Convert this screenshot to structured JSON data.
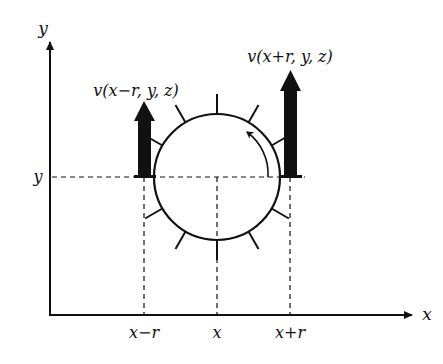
{
  "diagram": {
    "axes": {
      "x_label": "x",
      "y_label": "y"
    },
    "ticks": {
      "x_minus_r": "x−r",
      "x": "x",
      "x_plus_r": "x+r",
      "y": "y"
    },
    "vectors": {
      "left": "v(x−r, y, z)",
      "right": "v(x+r, y, z)"
    },
    "colors": {
      "stroke": "#111111",
      "background": "#ffffff"
    }
  }
}
